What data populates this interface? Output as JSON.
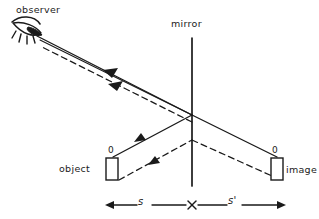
{
  "figure": {
    "ink_color": "#1a1a1a",
    "background_color": "#ffffff"
  },
  "labels": {
    "observer": "observer",
    "mirror": "mirror",
    "object": "object",
    "image": "image",
    "object_top_marker": "0",
    "image_top_marker": "0",
    "object_distance": "s",
    "image_distance": "s'"
  },
  "icons": {
    "eye": "observer-eye-icon",
    "object_box": "object-box-icon",
    "image_box": "image-box-icon",
    "mirror_line": "mirror-line-icon",
    "tick": "dimension-tick-icon"
  },
  "geometry": {
    "mirror_x": 192,
    "mirror_top_y": 38,
    "mirror_bottom_y": 186,
    "reflection_point": [
      192,
      115
    ],
    "observer_eye": [
      36,
      38
    ],
    "object_box": {
      "x": 106,
      "y": 158,
      "w": 12,
      "h": 22
    },
    "image_box": {
      "x": 271,
      "y": 158,
      "w": 12,
      "h": 22
    },
    "dimension_line_y": 205,
    "dimension_left_end": 105,
    "dimension_right_end": 285
  }
}
